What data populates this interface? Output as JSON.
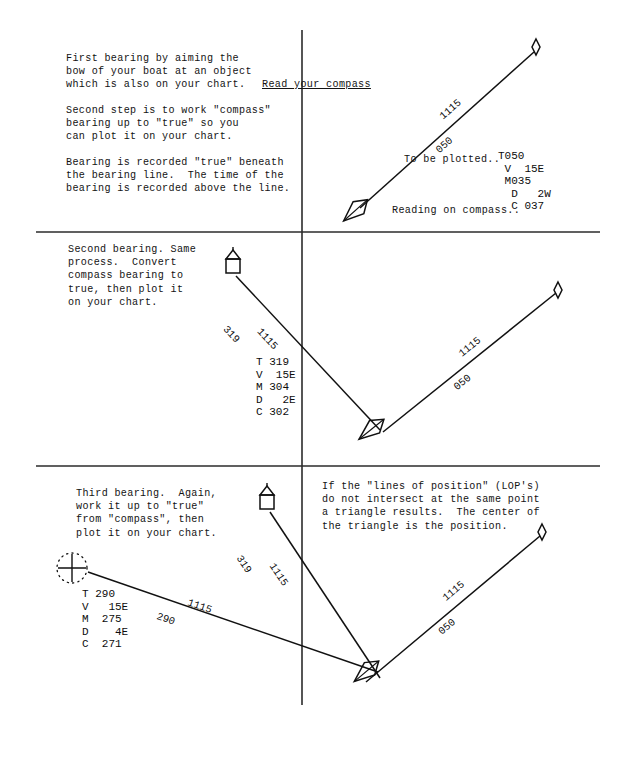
{
  "document": {
    "title": "Plotting Compass Bearings — Three-Bearing Fix",
    "type": "instructional-navigation-diagram"
  },
  "panels": [
    {
      "id": "panel-first-bearing",
      "paragraphs": [
        "First bearing by aiming the\nbow of your boat at an object\nwhich is also on your chart. ",
        "Second step is to work \"compass\"\nbearing up to \"true\" so you\ncan plot it on your chart.",
        "Bearing is recorded \"true\" beneath\nthe bearing line.  The time of the\nbearing is recorded above the line."
      ],
      "underlined_phrase": "Read your compass",
      "inline_notes": [
        "To be plotted..",
        "Reading on compass.."
      ],
      "line_label": {
        "time": "1115",
        "bearing": "050"
      },
      "bearing_work": {
        "rows": [
          {
            "label": "T",
            "value": "050"
          },
          {
            "label": "V",
            "value": "15E"
          },
          {
            "label": "M",
            "value": "035"
          },
          {
            "label": "D",
            "value": "2W"
          },
          {
            "label": "C",
            "value": "037"
          }
        ]
      },
      "symbols": {
        "target": "buoy-diamond",
        "vessel": "boat-hull"
      }
    },
    {
      "id": "panel-second-bearing",
      "paragraphs": [
        "Second bearing. Same\nprocess.  Convert\ncompass bearing to\ntrue, then plot it\non your chart."
      ],
      "line_labels": [
        {
          "time": "1115",
          "bearing": "319"
        },
        {
          "time": "1115",
          "bearing": "050"
        }
      ],
      "bearing_work": {
        "rows": [
          {
            "label": "T",
            "value": "319"
          },
          {
            "label": "V",
            "value": "15E"
          },
          {
            "label": "M",
            "value": "304"
          },
          {
            "label": "D",
            "value": "2E"
          },
          {
            "label": "C",
            "value": "302"
          }
        ]
      },
      "symbols": {
        "target_left": "landmark-house",
        "target_right": "buoy-diamond",
        "vessel": "boat-hull"
      }
    },
    {
      "id": "panel-third-bearing",
      "paragraphs": [
        "Third bearing.  Again,\nwork it up to \"true\"\nfrom \"compass\", then\nplot it on your chart.",
        "If the \"lines of position\" (LOP's)\ndo not intersect at the same point\na triangle results.  The center of\nthe triangle is the position."
      ],
      "line_labels": [
        {
          "time": "1115",
          "bearing": "290"
        },
        {
          "time": "1115",
          "bearing": "319"
        },
        {
          "time": "1115",
          "bearing": "050"
        }
      ],
      "bearing_work": {
        "rows": [
          {
            "label": "T",
            "value": "290"
          },
          {
            "label": "V",
            "value": "15E"
          },
          {
            "label": "M",
            "value": "275"
          },
          {
            "label": "D",
            "value": "4E"
          },
          {
            "label": "C",
            "value": "271"
          }
        ]
      },
      "symbols": {
        "target_left": "charted-object-cross",
        "target_mid": "landmark-house",
        "target_right": "buoy-diamond",
        "vessel": "boat-hull-fix"
      }
    }
  ],
  "bearing_text": {
    "panel1": "T050\n V  15E\n M035\n  D   2W\n  C 037",
    "panel2": "T 319\nV  15E\nM 304\nD   2E\nC 302",
    "panel3": "T 290\nV   15E\nM  275\nD    4E\nC  271"
  },
  "colors": {
    "ink": "#131313",
    "paper": "#ffffff",
    "rule": "#2b2b2b"
  }
}
